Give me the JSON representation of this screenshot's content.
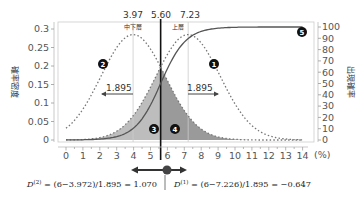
{
  "chart_data": {
    "type": "line",
    "title": "",
    "xlabel": "(%)",
    "ylabel_left": "確率密度",
    "ylabel_right": "出現確率",
    "x_ticks": [
      "0",
      "1",
      "2",
      "3",
      "4",
      "5",
      "6",
      "7",
      "8",
      "9",
      "10",
      "11",
      "12",
      "13",
      "14"
    ],
    "x_unit": "(%)",
    "xlim": [
      0,
      14
    ],
    "y_left_ticks": [
      "0",
      "0.05",
      "0.1",
      "0.15",
      "0.2",
      "0.25",
      "0.3"
    ],
    "ylim_left": [
      0,
      0.3
    ],
    "y_right_ticks": [
      "0",
      "10",
      "20",
      "30",
      "40",
      "50",
      "60",
      "70",
      "80",
      "90",
      "100"
    ],
    "ylim_right": [
      0,
      100
    ],
    "top_labels": [
      "3.97",
      "5.60",
      "7.23"
    ],
    "top_label_positions": [
      3.97,
      5.6,
      7.23
    ],
    "region_labels": [
      "中下層",
      "上層"
    ],
    "series": [
      {
        "name": "❷ 中下層 density",
        "style": "dotted",
        "mean": 3.972,
        "sd": 1.895,
        "peak": 0.285
      },
      {
        "name": "❶ 上層 density",
        "style": "dotted",
        "mean": 7.226,
        "sd": 1.895,
        "peak": 0.285
      },
      {
        "name": "❺ cumulative probability",
        "style": "solid",
        "axis": "right",
        "center": 5.6,
        "range": [
          0,
          100
        ]
      }
    ],
    "areas": [
      {
        "name": "❸",
        "from": 0,
        "to": 5.6,
        "shade": "light"
      },
      {
        "name": "❹",
        "from": 5.6,
        "to": 14,
        "shade": "dark"
      }
    ],
    "spread_annotations": [
      {
        "label": "1.895",
        "from": 2.08,
        "to": 3.97
      },
      {
        "label": "1.895",
        "from": 7.23,
        "to": 9.12
      }
    ],
    "markers": [
      "❶",
      "❷",
      "❸",
      "❹",
      "❺"
    ],
    "threshold": 5.6,
    "point_value": 6,
    "formulas": {
      "left": "D⁽²⁾ = (6−3.972)/1.895 = 1.070",
      "right": "D⁽¹⁾ = (6−7.226)/1.895 = −0.647"
    },
    "grid": false,
    "legend": "none"
  },
  "labels": {
    "top_1": "3.97",
    "top_2": "5.60",
    "top_3": "7.23",
    "region_lower": "中下層",
    "region_upper": "上層",
    "spread_left": "1.895",
    "spread_right": "1.895",
    "ylabel_left": "確率密度",
    "ylabel_right": "出現確率",
    "x_unit": "(%)",
    "marker_1": "1",
    "marker_2": "2",
    "marker_3": "3",
    "marker_4": "4",
    "marker_5": "5",
    "formula_left_d": "D",
    "formula_left_sup": "(2)",
    "formula_left_rest": " = (6−3.972)/1.895 = 1.070",
    "formula_right_d": "D",
    "formula_right_sup": "(1)",
    "formula_right_rest": " = (6−7.226)/1.895 = −0.647"
  }
}
